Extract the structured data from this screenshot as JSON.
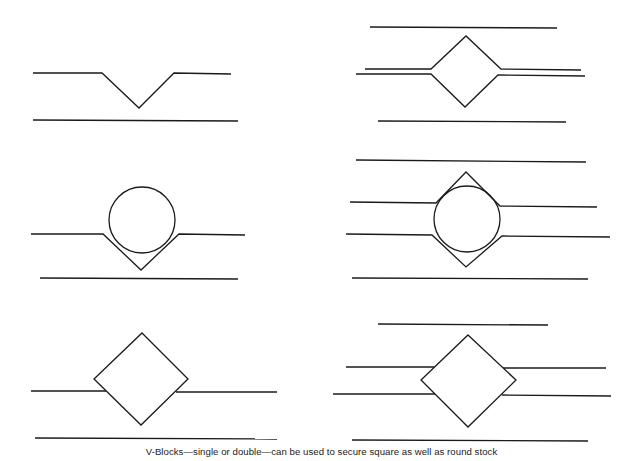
{
  "figure": {
    "caption": "V-Blocks—single or double—can be used to secure square as well as round stock",
    "panels": [
      {
        "id": "single-vblock-empty",
        "description": "Single V-block, empty"
      },
      {
        "id": "double-vblock-square",
        "description": "Double V-blocks securing square stock"
      },
      {
        "id": "single-vblock-round",
        "description": "Single V-block holding round stock"
      },
      {
        "id": "double-vblock-round",
        "description": "Double V-blocks securing round stock"
      },
      {
        "id": "single-vblock-square",
        "description": "Single V-block holding square stock"
      },
      {
        "id": "double-vblock-square-flat",
        "description": "Double flat blocks clamping square stock"
      }
    ],
    "stroke_color": "#1a1a1a",
    "background_color": "#ffffff"
  }
}
